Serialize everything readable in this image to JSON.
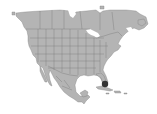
{
  "map": {
    "region": "North America",
    "land_color": "#b4b4b4",
    "border_color": "#6e6e6e",
    "background_color": "#ffffff",
    "markers": [
      {
        "name": "marker-south-florida",
        "x": 105,
        "y": 84,
        "r": 3.2,
        "color": "#333333"
      }
    ]
  }
}
